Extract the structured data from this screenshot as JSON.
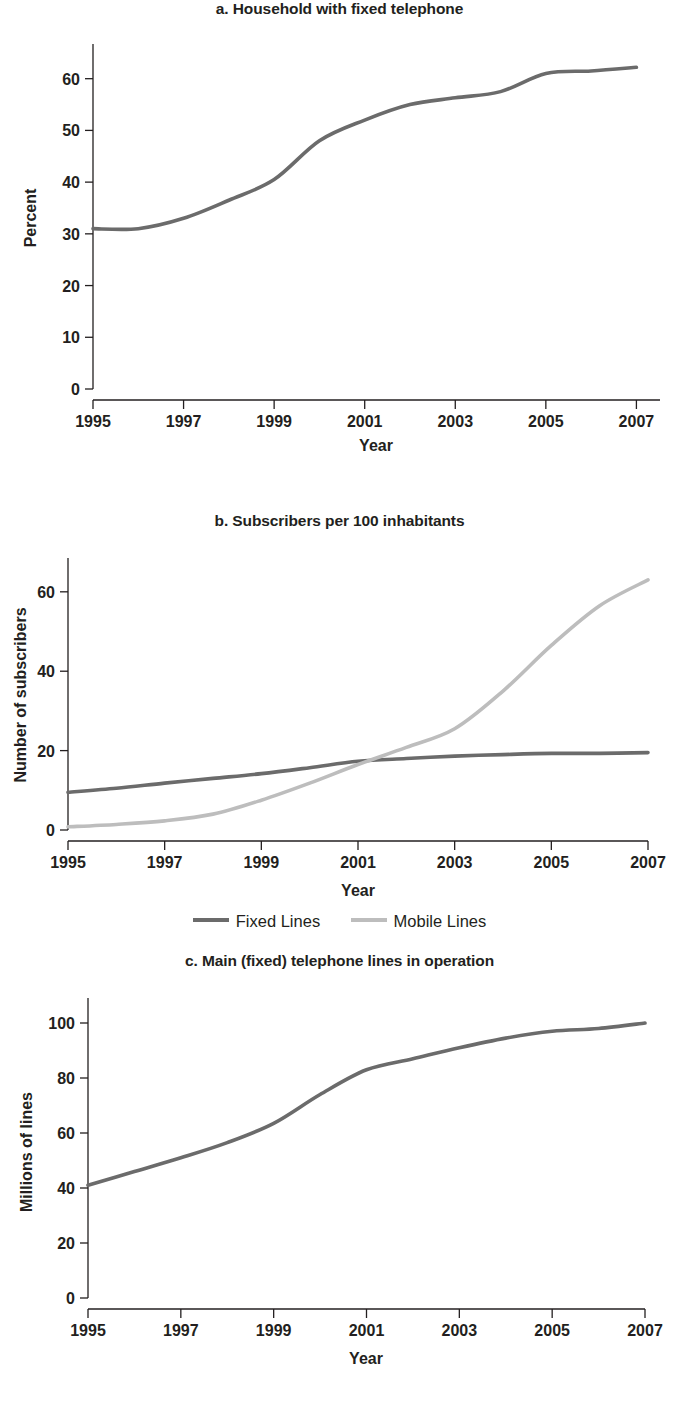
{
  "figure": {
    "background": "#ffffff",
    "text_color": "#231f20"
  },
  "colors": {
    "fixed_lines": "#6b6b6b",
    "mobile_lines": "#bdbdbd",
    "axis": "#231f20"
  },
  "panels": [
    {
      "id": "panel-a",
      "title": "a. Household with fixed telephone",
      "xlabel": "Year",
      "ylabel": "Percent",
      "y_ticks": [
        "0",
        "10",
        "20",
        "30",
        "40",
        "50",
        "60"
      ],
      "x_ticks": [
        "1995",
        "1997",
        "1999",
        "2001",
        "2003",
        "2005",
        "2007"
      ]
    },
    {
      "id": "panel-b",
      "title": "b. Subscribers per 100 inhabitants",
      "xlabel": "Year",
      "ylabel": "Number of subscribers",
      "y_ticks": [
        "0",
        "20",
        "40",
        "60"
      ],
      "x_ticks": [
        "1995",
        "1997",
        "1999",
        "2001",
        "2003",
        "2005",
        "2007"
      ],
      "legend": [
        {
          "label": "Fixed Lines",
          "color": "#6b6b6b"
        },
        {
          "label": "Mobile Lines",
          "color": "#bdbdbd"
        }
      ]
    },
    {
      "id": "panel-c",
      "title": "c. Main (fixed) telephone lines in operation",
      "xlabel": "Year",
      "ylabel": "Millions of lines",
      "y_ticks": [
        "0",
        "20",
        "40",
        "60",
        "80",
        "100"
      ],
      "x_ticks": [
        "1995",
        "1997",
        "1999",
        "2001",
        "2003",
        "2005",
        "2007"
      ]
    }
  ],
  "chart_data": [
    {
      "type": "line",
      "panel": "a",
      "title": "a. Household with fixed telephone",
      "xlabel": "Year",
      "ylabel": "Percent",
      "x": [
        1995,
        1996,
        1997,
        1998,
        1999,
        2000,
        2001,
        2002,
        2003,
        2004,
        2005,
        2006,
        2007
      ],
      "xlim": [
        1995,
        2007.3
      ],
      "ylim": [
        0,
        64
      ],
      "xticks": [
        1995,
        1997,
        1999,
        2001,
        2003,
        2005,
        2007
      ],
      "yticks": [
        0,
        10,
        20,
        30,
        40,
        50,
        60
      ],
      "grid": false,
      "legend": null,
      "series": [
        {
          "name": "Household with fixed telephone",
          "color": "#6b6b6b",
          "values": [
            31.0,
            31.0,
            33.0,
            36.5,
            40.5,
            48.0,
            52.0,
            55.0,
            56.3,
            57.5,
            61.0,
            61.5,
            62.2
          ]
        }
      ]
    },
    {
      "type": "line",
      "panel": "b",
      "title": "b. Subscribers per 100 inhabitants",
      "xlabel": "Year",
      "ylabel": "Number of subscribers",
      "x": [
        1995,
        1996,
        1997,
        1998,
        1999,
        2000,
        2001,
        2002,
        2003,
        2004,
        2005,
        2006,
        2007
      ],
      "xlim": [
        1995,
        2007
      ],
      "ylim": [
        0,
        66
      ],
      "xticks": [
        1995,
        1997,
        1999,
        2001,
        2003,
        2005,
        2007
      ],
      "yticks": [
        0,
        20,
        40,
        60
      ],
      "grid": false,
      "legend_position": "below",
      "series": [
        {
          "name": "Fixed Lines",
          "color": "#6b6b6b",
          "values": [
            9.5,
            10.5,
            11.8,
            13.0,
            14.2,
            15.7,
            17.3,
            18.0,
            18.6,
            19.0,
            19.3,
            19.3,
            19.5
          ]
        },
        {
          "name": "Mobile Lines",
          "color": "#bdbdbd",
          "values": [
            0.8,
            1.4,
            2.3,
            4.0,
            7.5,
            11.8,
            16.5,
            20.8,
            25.5,
            35.0,
            46.5,
            56.5,
            63.0
          ]
        }
      ]
    },
    {
      "type": "line",
      "panel": "c",
      "title": "c. Main (fixed) telephone lines in operation",
      "xlabel": "Year",
      "ylabel": "Millions of lines",
      "x": [
        1995,
        1996,
        1997,
        1998,
        1999,
        2000,
        2001,
        2002,
        2003,
        2004,
        2005,
        2006,
        2007
      ],
      "xlim": [
        1995,
        2007
      ],
      "ylim": [
        0,
        104
      ],
      "xticks": [
        1995,
        1997,
        1999,
        2001,
        2003,
        2005,
        2007
      ],
      "yticks": [
        0,
        20,
        40,
        60,
        80,
        100
      ],
      "grid": false,
      "legend": null,
      "series": [
        {
          "name": "Main (fixed) telephone lines in operation",
          "color": "#6b6b6b",
          "values": [
            41.0,
            46.0,
            51.0,
            56.5,
            63.5,
            74.0,
            83.0,
            87.0,
            91.0,
            94.5,
            97.0,
            98.0,
            100.0
          ]
        }
      ]
    }
  ]
}
